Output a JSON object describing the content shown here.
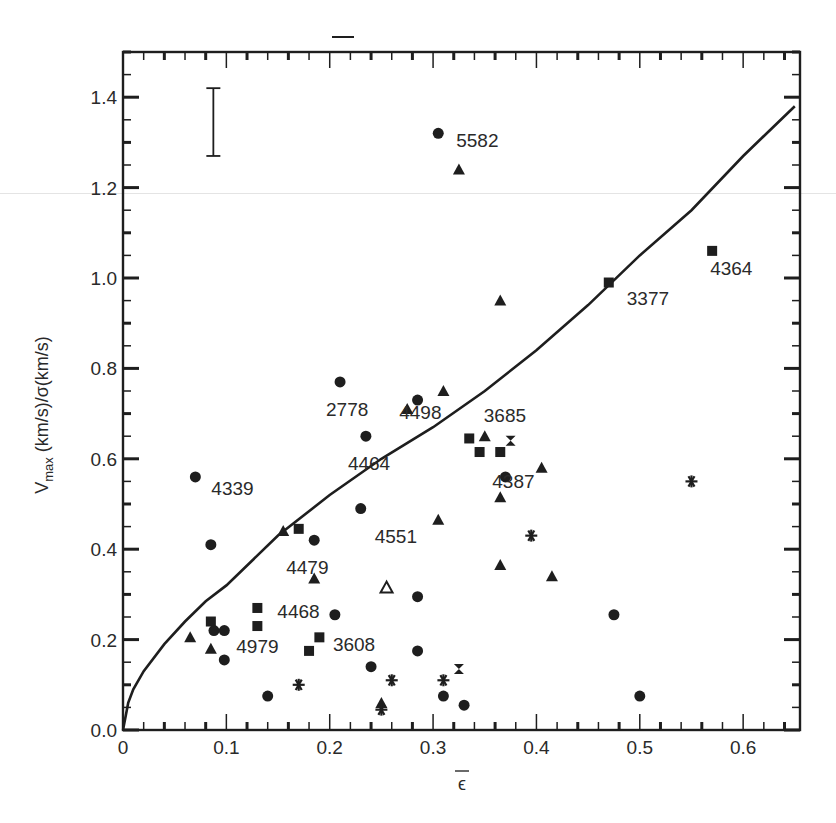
{
  "figure": {
    "background": "#ffffff",
    "ink": "#1e1e1e"
  },
  "chart_data": {
    "type": "scatter",
    "title": "",
    "xlabel": "ε̄",
    "ylabel": "V_max (km/s)/σ(km/s)",
    "ylabel_parts": {
      "v": "V",
      "sub": "max",
      "rest": " (km/s)/σ(km/s)"
    },
    "xlim": [
      0,
      0.655
    ],
    "ylim": [
      0,
      1.5
    ],
    "x_ticks": [
      {
        "value": 0,
        "label": "0"
      },
      {
        "value": 0.1,
        "label": "0.1"
      },
      {
        "value": 0.2,
        "label": "0.2"
      },
      {
        "value": 0.3,
        "label": "0.3"
      },
      {
        "value": 0.4,
        "label": "0.4"
      },
      {
        "value": 0.5,
        "label": "0.5"
      },
      {
        "value": 0.6,
        "label": "0.6"
      }
    ],
    "y_ticks": [
      {
        "value": 0.0,
        "label": "0.0"
      },
      {
        "value": 0.2,
        "label": "0.2"
      },
      {
        "value": 0.4,
        "label": "0.4"
      },
      {
        "value": 0.6,
        "label": "0.6"
      },
      {
        "value": 0.8,
        "label": "0.8"
      },
      {
        "value": 1.0,
        "label": "1.0"
      },
      {
        "value": 1.2,
        "label": "1.2"
      },
      {
        "value": 1.4,
        "label": "1.4"
      }
    ],
    "grid": false,
    "legend": null,
    "error_bar": {
      "x": 0.07,
      "y_low": 1.27,
      "y_high": 1.42,
      "label": "typical error"
    },
    "model_curve": {
      "name": "oblate isotropic rotator",
      "x": [
        0,
        0.005,
        0.01,
        0.02,
        0.04,
        0.06,
        0.08,
        0.1,
        0.15,
        0.2,
        0.25,
        0.3,
        0.35,
        0.4,
        0.45,
        0.5,
        0.55,
        0.6,
        0.65
      ],
      "y": [
        0,
        0.06,
        0.09,
        0.13,
        0.19,
        0.24,
        0.285,
        0.32,
        0.43,
        0.52,
        0.6,
        0.67,
        0.75,
        0.84,
        0.94,
        1.05,
        1.15,
        1.27,
        1.38
      ]
    },
    "points": [
      {
        "x": 0.305,
        "y": 1.32,
        "marker": "circle",
        "label": "5582"
      },
      {
        "x": 0.325,
        "y": 1.24,
        "marker": "triangle",
        "label": ""
      },
      {
        "x": 0.57,
        "y": 1.06,
        "marker": "square",
        "label": "4364"
      },
      {
        "x": 0.47,
        "y": 0.99,
        "marker": "square",
        "label": "3377"
      },
      {
        "x": 0.365,
        "y": 0.95,
        "marker": "triangle",
        "label": ""
      },
      {
        "x": 0.21,
        "y": 0.77,
        "marker": "circle",
        "label": "2778"
      },
      {
        "x": 0.31,
        "y": 0.75,
        "marker": "triangle",
        "label": ""
      },
      {
        "x": 0.285,
        "y": 0.73,
        "marker": "circle",
        "label": ""
      },
      {
        "x": 0.275,
        "y": 0.71,
        "marker": "triangle",
        "label": "4498"
      },
      {
        "x": 0.235,
        "y": 0.65,
        "marker": "circle",
        "label": "4464"
      },
      {
        "x": 0.35,
        "y": 0.65,
        "marker": "triangle",
        "label": "3685"
      },
      {
        "x": 0.335,
        "y": 0.645,
        "marker": "square",
        "label": ""
      },
      {
        "x": 0.375,
        "y": 0.64,
        "marker": "hourglass",
        "label": ""
      },
      {
        "x": 0.345,
        "y": 0.615,
        "marker": "square",
        "label": ""
      },
      {
        "x": 0.365,
        "y": 0.615,
        "marker": "square",
        "label": "4387"
      },
      {
        "x": 0.405,
        "y": 0.58,
        "marker": "triangle",
        "label": ""
      },
      {
        "x": 0.07,
        "y": 0.56,
        "marker": "circle",
        "label": "4339"
      },
      {
        "x": 0.37,
        "y": 0.56,
        "marker": "circle",
        "label": ""
      },
      {
        "x": 0.55,
        "y": 0.55,
        "marker": "asterisk",
        "label": ""
      },
      {
        "x": 0.365,
        "y": 0.515,
        "marker": "triangle",
        "label": ""
      },
      {
        "x": 0.23,
        "y": 0.49,
        "marker": "circle",
        "label": "4551"
      },
      {
        "x": 0.305,
        "y": 0.465,
        "marker": "triangle",
        "label": ""
      },
      {
        "x": 0.155,
        "y": 0.44,
        "marker": "triangle",
        "label": ""
      },
      {
        "x": 0.17,
        "y": 0.445,
        "marker": "square",
        "label": ""
      },
      {
        "x": 0.395,
        "y": 0.43,
        "marker": "asterisk",
        "label": ""
      },
      {
        "x": 0.185,
        "y": 0.42,
        "marker": "circle",
        "label": "4479"
      },
      {
        "x": 0.085,
        "y": 0.41,
        "marker": "circle",
        "label": ""
      },
      {
        "x": 0.365,
        "y": 0.365,
        "marker": "triangle",
        "label": ""
      },
      {
        "x": 0.415,
        "y": 0.34,
        "marker": "triangle",
        "label": ""
      },
      {
        "x": 0.185,
        "y": 0.335,
        "marker": "triangle",
        "label": ""
      },
      {
        "x": 0.255,
        "y": 0.315,
        "marker": "triangle-open",
        "label": ""
      },
      {
        "x": 0.285,
        "y": 0.295,
        "marker": "circle",
        "label": ""
      },
      {
        "x": 0.13,
        "y": 0.27,
        "marker": "square",
        "label": "4468"
      },
      {
        "x": 0.205,
        "y": 0.255,
        "marker": "circle",
        "label": "3608"
      },
      {
        "x": 0.475,
        "y": 0.255,
        "marker": "circle",
        "label": ""
      },
      {
        "x": 0.085,
        "y": 0.24,
        "marker": "square",
        "label": ""
      },
      {
        "x": 0.13,
        "y": 0.23,
        "marker": "square",
        "label": ""
      },
      {
        "x": 0.088,
        "y": 0.22,
        "marker": "circle",
        "label": ""
      },
      {
        "x": 0.098,
        "y": 0.22,
        "marker": "circle",
        "label": "4979"
      },
      {
        "x": 0.065,
        "y": 0.205,
        "marker": "triangle",
        "label": ""
      },
      {
        "x": 0.19,
        "y": 0.205,
        "marker": "square",
        "label": ""
      },
      {
        "x": 0.085,
        "y": 0.18,
        "marker": "triangle",
        "label": ""
      },
      {
        "x": 0.18,
        "y": 0.175,
        "marker": "square",
        "label": ""
      },
      {
        "x": 0.285,
        "y": 0.175,
        "marker": "circle",
        "label": ""
      },
      {
        "x": 0.098,
        "y": 0.155,
        "marker": "circle",
        "label": ""
      },
      {
        "x": 0.24,
        "y": 0.14,
        "marker": "circle",
        "label": ""
      },
      {
        "x": 0.325,
        "y": 0.135,
        "marker": "hourglass",
        "label": ""
      },
      {
        "x": 0.26,
        "y": 0.11,
        "marker": "asterisk",
        "label": ""
      },
      {
        "x": 0.31,
        "y": 0.11,
        "marker": "asterisk",
        "label": ""
      },
      {
        "x": 0.17,
        "y": 0.1,
        "marker": "asterisk",
        "label": ""
      },
      {
        "x": 0.14,
        "y": 0.075,
        "marker": "circle",
        "label": ""
      },
      {
        "x": 0.31,
        "y": 0.075,
        "marker": "circle",
        "label": ""
      },
      {
        "x": 0.5,
        "y": 0.075,
        "marker": "circle",
        "label": ""
      },
      {
        "x": 0.25,
        "y": 0.06,
        "marker": "triangle",
        "label": ""
      },
      {
        "x": 0.25,
        "y": 0.045,
        "marker": "asterisk",
        "label": ""
      },
      {
        "x": 0.33,
        "y": 0.055,
        "marker": "circle",
        "label": ""
      }
    ]
  }
}
